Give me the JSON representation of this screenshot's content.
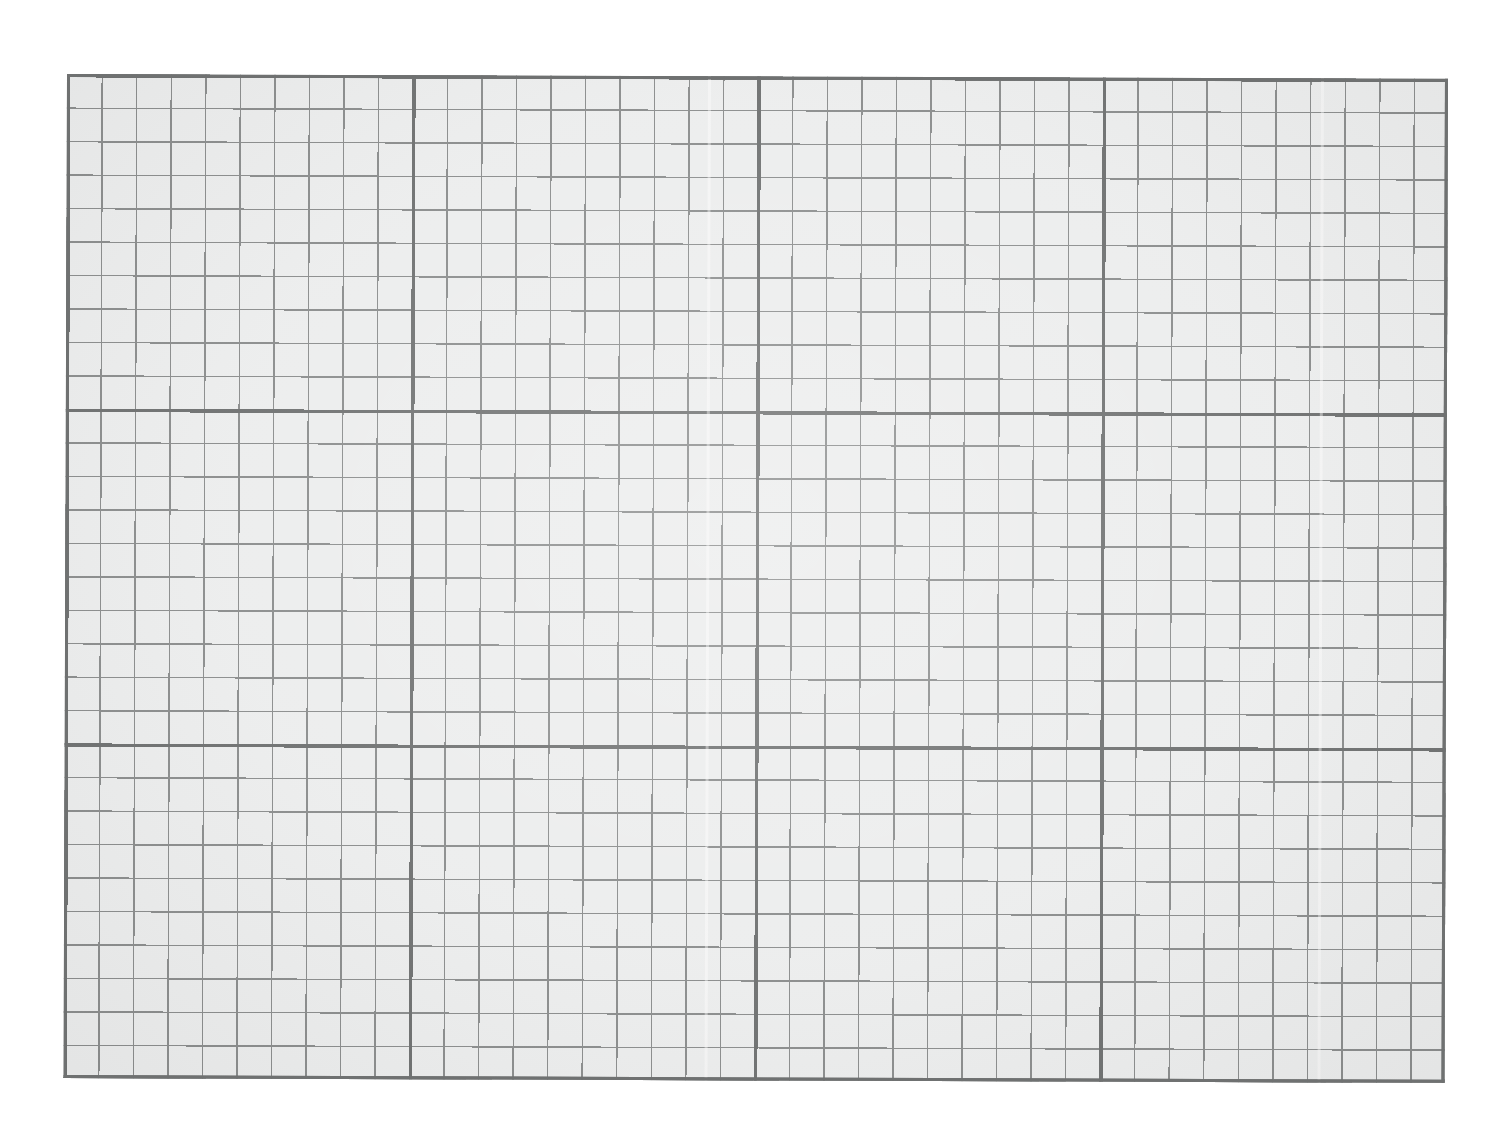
{
  "document": {
    "kind": "graph-paper-scan",
    "surface_label": "graph paper sheet"
  },
  "colors": {
    "page_background": "#ffffff",
    "sheet_background": "#eceded",
    "minor_line": "#8b8d8d",
    "major_line": "#6f7171"
  },
  "chart_data": {
    "type": "table",
    "title": "",
    "subtitle": "",
    "xlabel": "",
    "ylabel": "",
    "grid": true,
    "legend": "none",
    "series": [],
    "categories": [],
    "values": [],
    "annotations": [],
    "grid_spec": {
      "minor_columns": 40,
      "minor_rows": 30,
      "major_columns": 4,
      "major_rows": 3,
      "minor_cells_per_major": 10,
      "minor_cell_width_px": 34.53,
      "minor_cell_height_px": 33.47,
      "major_cell_width_px": 345.25,
      "major_cell_height_px": 334.67,
      "sheet_left_px": 67,
      "sheet_top_px": 74,
      "sheet_width_px": 1381,
      "sheet_height_px": 1004,
      "skew_degrees": 0.2,
      "major_x_positions_px": [
        68,
        412,
        755,
        1098,
        1448
      ],
      "major_y_positions_px": [
        76,
        405,
        740,
        1077
      ]
    }
  },
  "artifacts": {
    "scan_streaks_x_px": [
      709,
      1322
    ]
  }
}
